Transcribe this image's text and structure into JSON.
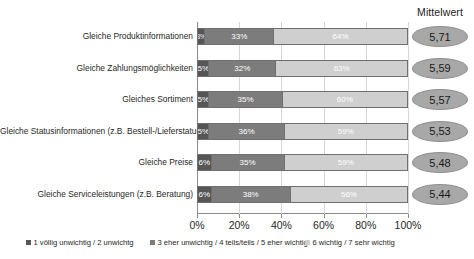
{
  "header": {
    "mean_column_title": "Mittelwert"
  },
  "legend": {
    "items": [
      {
        "label": "1 völlig unwichtig / 2 unwichtg",
        "color": "#565656",
        "swatch_name": "legend-swatch-series-1"
      },
      {
        "label": "3 eher unwichtig / 4 teils/teils / 5 eher wichtig",
        "color": "#7c7c7c",
        "swatch_name": "legend-swatch-series-2"
      },
      {
        "label": "6 wichtig / 7 sehr wichtig",
        "color": "#cfcfcf",
        "swatch_name": "legend-swatch-series-3"
      }
    ]
  },
  "axis": {
    "x_ticks": [
      "0%",
      "20%",
      "40%",
      "60%",
      "80%",
      "100%"
    ],
    "x_tick_values": [
      0,
      20,
      40,
      60,
      80,
      100
    ]
  },
  "rows": [
    {
      "category": "Gleiche Produktinformationen",
      "s1": "3%",
      "s2": "33%",
      "s3": "64%",
      "mean": "5,71"
    },
    {
      "category": "Gleiche Zahlungsmöglichkeiten",
      "s1": "5%",
      "s2": "32%",
      "s3": "63%",
      "mean": "5,59"
    },
    {
      "category": "Gleiches Sortiment",
      "s1": "5%",
      "s2": "35%",
      "s3": "60%",
      "mean": "5,57"
    },
    {
      "category": "Gleiche Statusinformationen (z.B. Bestell-/Lieferstatus)",
      "s1": "5%",
      "s2": "36%",
      "s3": "59%",
      "mean": "5,53"
    },
    {
      "category": "Gleiche Preise",
      "s1": "6%",
      "s2": "35%",
      "s3": "59%",
      "mean": "5,48"
    },
    {
      "category": "Gleiche Serviceleistungen (z.B. Beratung)",
      "s1": "6%",
      "s2": "38%",
      "s3": "56%",
      "mean": "5,44"
    }
  ],
  "chart_data": {
    "type": "bar",
    "orientation": "horizontal",
    "stacked": true,
    "normalized": "100%",
    "title": "",
    "subtitle": "",
    "xlabel": "",
    "ylabel": "",
    "xlim": [
      0,
      100
    ],
    "grid": true,
    "grid_axis": "x",
    "legend_position": "bottom",
    "categories": [
      "Gleiche Produktinformationen",
      "Gleiche Zahlungsmöglichkeiten",
      "Gleiches Sortiment",
      "Gleiche Statusinformationen (z.B. Bestell-/Lieferstatus)",
      "Gleiche Preise",
      "Gleiche Serviceleistungen (z.B. Beratung)"
    ],
    "series": [
      {
        "name": "1 völlig unwichtig / 2 unwichtg",
        "color": "#565656",
        "values": [
          3,
          5,
          5,
          5,
          6,
          6
        ]
      },
      {
        "name": "3 eher unwichtig / 4 teils/teils / 5 eher wichtig",
        "color": "#7c7c7c",
        "values": [
          33,
          32,
          35,
          36,
          35,
          38
        ]
      },
      {
        "name": "6 wichtig / 7 sehr wichtig",
        "color": "#cfcfcf",
        "values": [
          64,
          63,
          60,
          59,
          59,
          56
        ]
      }
    ],
    "annotations": {
      "mean_column_title": "Mittelwert",
      "means": [
        "5,71",
        "5,59",
        "5,57",
        "5,53",
        "5,48",
        "5,44"
      ]
    },
    "xtick_labels": [
      "0%",
      "20%",
      "40%",
      "60%",
      "80%",
      "100%"
    ]
  }
}
